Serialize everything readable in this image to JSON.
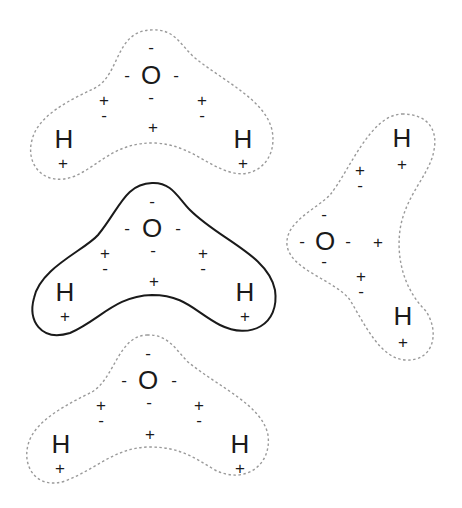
{
  "diagram": {
    "title": "",
    "symbols": {
      "oxygen": "O",
      "hydrogen": "H",
      "positive": "+",
      "negative": "-"
    },
    "molecules": [
      {
        "id": "top",
        "outline": "dashed",
        "orientation": "V-shape"
      },
      {
        "id": "middle",
        "outline": "solid",
        "orientation": "V-shape",
        "highlighted": true
      },
      {
        "id": "bottom",
        "outline": "dashed",
        "orientation": "V-shape"
      },
      {
        "id": "right",
        "outline": "dashed",
        "orientation": "rotated, opening right"
      }
    ],
    "colors": {
      "text": "#1a1a1a",
      "dashed_outline": "#9a9a9a",
      "solid_outline": "#1a1a1a",
      "background": "#ffffff"
    }
  }
}
